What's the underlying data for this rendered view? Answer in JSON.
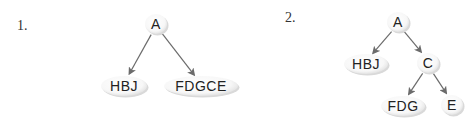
{
  "diagrams": [
    {
      "label": "1.",
      "nodes": [
        {
          "id": "A",
          "text": "A",
          "x": 156,
          "y": 24,
          "rx": 11,
          "ry": 10
        },
        {
          "id": "HBJ",
          "text": "HBJ",
          "x": 124,
          "y": 86,
          "rx": 23,
          "ry": 10
        },
        {
          "id": "FDGCE",
          "text": "FDGCE",
          "x": 201,
          "y": 86,
          "rx": 37,
          "ry": 10
        }
      ],
      "edges": [
        {
          "from": "A",
          "to": "HBJ"
        },
        {
          "from": "A",
          "to": "FDGCE"
        }
      ]
    },
    {
      "label": "2.",
      "nodes": [
        {
          "id": "A",
          "text": "A",
          "x": 398,
          "y": 22,
          "rx": 11,
          "ry": 10
        },
        {
          "id": "HBJ",
          "text": "HBJ",
          "x": 366,
          "y": 64,
          "rx": 22,
          "ry": 10
        },
        {
          "id": "C",
          "text": "C",
          "x": 428,
          "y": 63,
          "rx": 11,
          "ry": 10
        },
        {
          "id": "FDG",
          "text": "FDG",
          "x": 403,
          "y": 106,
          "rx": 22,
          "ry": 10
        },
        {
          "id": "E",
          "text": "E",
          "x": 452,
          "y": 105,
          "rx": 11,
          "ry": 10
        }
      ],
      "edges": [
        {
          "from": "A",
          "to": "HBJ"
        },
        {
          "from": "A",
          "to": "C"
        },
        {
          "from": "C",
          "to": "FDG"
        },
        {
          "from": "C",
          "to": "E"
        }
      ]
    }
  ],
  "colors": {
    "edge": "#6b6b6b",
    "node_fill": "#ffffff",
    "node_shadow": "#d9d9d9",
    "text": "#222222"
  }
}
